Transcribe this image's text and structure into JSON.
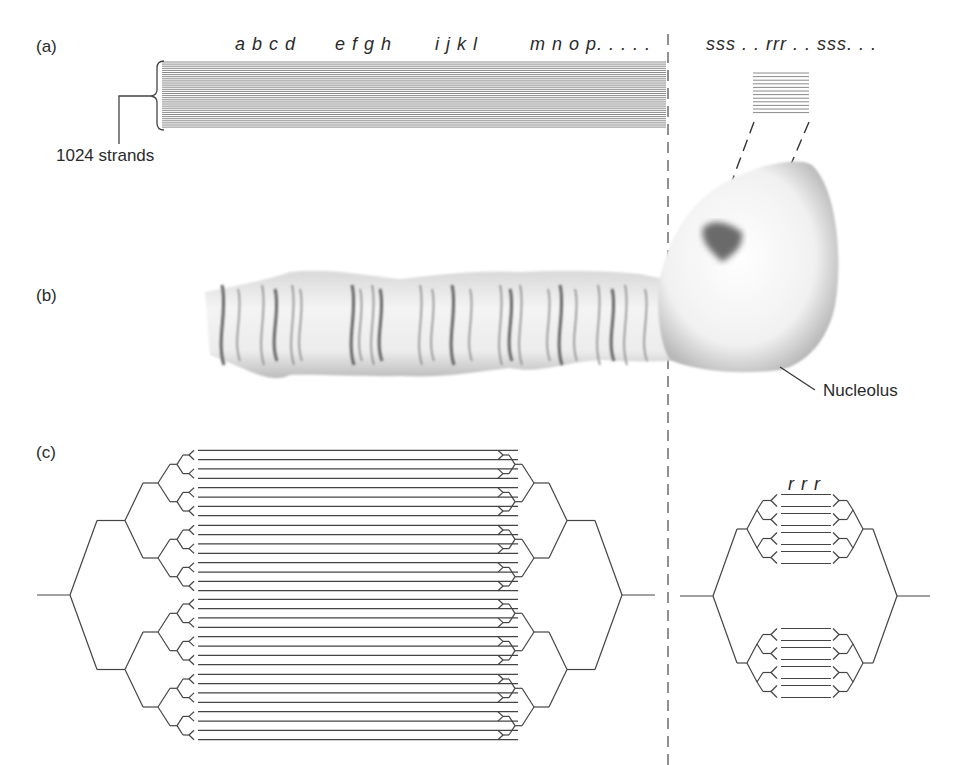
{
  "panels": {
    "a": {
      "label": "(a)",
      "gene_labels": [
        "a b c d",
        "e f g h",
        "i j k l",
        "m n o p. . . . ."
      ],
      "rdna_label": "sss . . rrr . . sss. . .",
      "strand_count_label": "1024 strands"
    },
    "b": {
      "label": "(b)",
      "nucleolus_label": "Nucleolus"
    },
    "c": {
      "label": "(c)",
      "rrr_label": "r r r"
    }
  },
  "colors": {
    "line": "#444444",
    "strand": "#7a7a7a",
    "chromosome_band": "#6e6e6e",
    "nucleolus_spot": "#6a6a6a"
  }
}
